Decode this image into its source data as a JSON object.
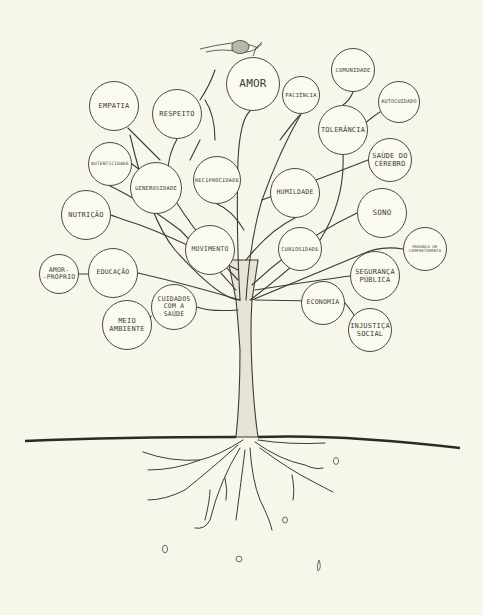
{
  "diagram": {
    "type": "tree-of-wellbeing",
    "background_color": "#f7f6ea",
    "line_color": "#3a3a36",
    "nodes": [
      {
        "id": "amor",
        "label": "AMOR",
        "cx": 253,
        "cy": 84,
        "r": 27,
        "fs": 11
      },
      {
        "id": "paciencia",
        "label": "PACIÊNCIA",
        "cx": 301,
        "cy": 95,
        "r": 19,
        "fs": 5.5
      },
      {
        "id": "comunidade",
        "label": "COMUNIDADE",
        "cx": 353,
        "cy": 70,
        "r": 22,
        "fs": 5.5
      },
      {
        "id": "autocuidado",
        "label": "AUTOCUIDADO",
        "cx": 399,
        "cy": 102,
        "r": 21,
        "fs": 5
      },
      {
        "id": "tolerancia",
        "label": "TOLERÂNCIA",
        "cx": 343,
        "cy": 130,
        "r": 25,
        "fs": 7
      },
      {
        "id": "saude-do-cerebro",
        "label": "SAÚDE DO\nCÉREBRO",
        "cx": 390,
        "cy": 160,
        "r": 22,
        "fs": 7
      },
      {
        "id": "empatia",
        "label": "EMPATIA",
        "cx": 114,
        "cy": 106,
        "r": 25,
        "fs": 7
      },
      {
        "id": "respeito",
        "label": "RESPEITO",
        "cx": 177,
        "cy": 114,
        "r": 25,
        "fs": 7
      },
      {
        "id": "autenticidade",
        "label": "AUTENTICIDADE",
        "cx": 110,
        "cy": 164,
        "r": 22,
        "fs": 4.5
      },
      {
        "id": "generosidade",
        "label": "GENEROSIDADE",
        "cx": 156,
        "cy": 188,
        "r": 26,
        "fs": 5.5
      },
      {
        "id": "reciprocidade",
        "label": "RECIPROCIDADE",
        "cx": 217,
        "cy": 180,
        "r": 24,
        "fs": 5.3
      },
      {
        "id": "humildade",
        "label": "HUMILDADE",
        "cx": 295,
        "cy": 193,
        "r": 25,
        "fs": 6.5
      },
      {
        "id": "sono",
        "label": "SONO",
        "cx": 382,
        "cy": 213,
        "r": 25,
        "fs": 7.5
      },
      {
        "id": "nutricao",
        "label": "NUTRIÇÃO",
        "cx": 86,
        "cy": 215,
        "r": 25,
        "fs": 7
      },
      {
        "id": "mudanca-de-comportamento",
        "label": "MUDANÇA DE\nCOMPORTAMENTO",
        "cx": 425,
        "cy": 249,
        "r": 22,
        "fs": 3.8
      },
      {
        "id": "movimento",
        "label": "MOVIMENTO",
        "cx": 210,
        "cy": 250,
        "r": 25,
        "fs": 6.5
      },
      {
        "id": "curiosidade",
        "label": "CURIOSIDADE",
        "cx": 300,
        "cy": 249,
        "r": 22,
        "fs": 5.3
      },
      {
        "id": "amor-proprio",
        "label": "AMOR-\n-PRÓPRIO",
        "cx": 59,
        "cy": 274,
        "r": 20,
        "fs": 6.5
      },
      {
        "id": "educacao",
        "label": "EDUCAÇÃO",
        "cx": 113,
        "cy": 273,
        "r": 25,
        "fs": 6.5
      },
      {
        "id": "seguranca-publica",
        "label": "SEGURANÇA\nPÚBLICA",
        "cx": 375,
        "cy": 276,
        "r": 25,
        "fs": 7
      },
      {
        "id": "economia",
        "label": "ECONOMIA",
        "cx": 323,
        "cy": 303,
        "r": 22,
        "fs": 6.5
      },
      {
        "id": "cuidados-com-a-saude",
        "label": "CUIDADOS\nCOM A\nSAÚDE",
        "cx": 174,
        "cy": 307,
        "r": 23,
        "fs": 6.5
      },
      {
        "id": "meio-ambiente",
        "label": "MEIO\nAMBIENTE",
        "cx": 127,
        "cy": 325,
        "r": 25,
        "fs": 7
      },
      {
        "id": "injustica-social",
        "label": "INJUSTIÇA\nSOCIAL",
        "cx": 370,
        "cy": 330,
        "r": 22,
        "fs": 7
      }
    ],
    "ground_line": {
      "y_left": 441,
      "y_center": 437,
      "y_right": 448
    }
  }
}
